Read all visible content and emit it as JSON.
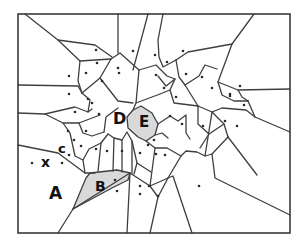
{
  "diagram": {
    "type": "voronoi",
    "frame": {
      "x": 18,
      "y": 14,
      "w": 272,
      "h": 219
    },
    "colors": {
      "edge": "#3f3f3f",
      "shade": "#d9d9d9",
      "site": "#2a2a2a",
      "label": "#111111"
    },
    "labels": [
      {
        "id": "A",
        "text": "A",
        "x": 49,
        "y": 199,
        "size": 17
      },
      {
        "id": "B",
        "text": "B",
        "x": 95,
        "y": 191,
        "size": 14
      },
      {
        "id": "C",
        "text": "c",
        "x": 58,
        "y": 153,
        "size": 13
      },
      {
        "id": "D",
        "text": "D",
        "x": 113,
        "y": 124,
        "size": 16
      },
      {
        "id": "E",
        "text": "E",
        "x": 139,
        "y": 127,
        "size": 15
      },
      {
        "id": "X",
        "text": "x",
        "x": 41,
        "y": 167,
        "size": 14
      }
    ],
    "shaded_cells": [
      {
        "id": "B",
        "points": "90,173 117,170 130,173 128,180 112,188 73,209 86,178"
      },
      {
        "id": "E",
        "points": "133,110 141,106 152,113 158,124 155,135 146,141 138,137 128,128 127,117"
      }
    ],
    "sites": [
      [
        96,
        50
      ],
      [
        133,
        51
      ],
      [
        155,
        55
      ],
      [
        183,
        51
      ],
      [
        167,
        62
      ],
      [
        97,
        63
      ],
      [
        118,
        68
      ],
      [
        119,
        73
      ],
      [
        86,
        73
      ],
      [
        69,
        76
      ],
      [
        102,
        81
      ],
      [
        156,
        75
      ],
      [
        186,
        74
      ],
      [
        202,
        77
      ],
      [
        164,
        88
      ],
      [
        212,
        88
      ],
      [
        230,
        94
      ],
      [
        240,
        86
      ],
      [
        69,
        94
      ],
      [
        88,
        99
      ],
      [
        92,
        103
      ],
      [
        176,
        97
      ],
      [
        75,
        112
      ],
      [
        99,
        114
      ],
      [
        170,
        116
      ],
      [
        182,
        124
      ],
      [
        203,
        126
      ],
      [
        225,
        121
      ],
      [
        237,
        126
      ],
      [
        230,
        96
      ],
      [
        244,
        105
      ],
      [
        68,
        131
      ],
      [
        86,
        131
      ],
      [
        74,
        140
      ],
      [
        81,
        146
      ],
      [
        96,
        149
      ],
      [
        107,
        151
      ],
      [
        122,
        151
      ],
      [
        140,
        153
      ],
      [
        154,
        140
      ],
      [
        156,
        154
      ],
      [
        165,
        155
      ],
      [
        69,
        155
      ],
      [
        62,
        163
      ],
      [
        115,
        180
      ],
      [
        117,
        191
      ],
      [
        140,
        186
      ],
      [
        149,
        186
      ],
      [
        140,
        194
      ],
      [
        158,
        196
      ],
      [
        199,
        186
      ],
      [
        32,
        163
      ],
      [
        148,
        145
      ]
    ],
    "edges": [
      "M 25,14 L 58,40 L 95,45 L 112,57",
      "M 58,40 L 80,61 L 78,81 L 82,93",
      "M 80,61 L 111,59 L 120,53 L 139,70",
      "M 118,14 L 118,53",
      "M 148,14 L 133,70",
      "M 163,14 L 158,40 L 159,57 L 163,67 L 176,60",
      "M 176,60 L 188,52 L 232,44 L 254,14",
      "M 232,44 L 218,82 L 222,95 L 234,101 L 248,101",
      "M 248,101 L 242,97 L 238,90 L 218,82",
      "M 238,90 L 290,89",
      "M 248,101 L 255,117 L 290,132",
      "M 255,117 L 246,110 L 222,108 L 212,112",
      "M 18,85 L 78,86 L 82,93",
      "M 82,93 L 100,78 L 111,59",
      "M 100,78 L 118,101 L 133,103",
      "M 82,93 L 90,100 L 88,112",
      "M 18,113 L 45,114 L 75,107 L 88,112 L 92,109",
      "M 45,114 L 63,123 L 79,123 L 100,115",
      "M 79,123 L 83,133 L 92,136 L 104,132",
      "M 104,132 L 106,117 L 118,108",
      "M 139,70 L 136,103 L 133,110",
      "M 139,70 L 156,65 L 167,76 L 175,79 L 170,90 L 174,103 L 198,106",
      "M 136,103 L 160,94 L 170,90",
      "M 158,76 L 166,86 L 175,79",
      "M 176,60 L 179,77 L 185,85 L 199,76 L 205,65 L 217,69",
      "M 185,85 L 198,106 L 212,112 L 224,124 L 228,137",
      "M 198,106 L 198,124 L 209,134 L 224,124",
      "M 209,134 L 200,148",
      "M 228,137 L 212,154 L 205,156 L 197,152 L 186,151 L 181,156",
      "M 212,154 L 215,178 L 290,215",
      "M 228,137 L 257,175",
      "M 212,112 L 205,156",
      "M 18,145 L 58,153 L 85,173 L 95,173",
      "M 63,123 L 70,133 L 75,156 L 83,160 L 85,173",
      "M 83,160 L 89,149 L 101,143 L 108,134",
      "M 101,143 L 98,171",
      "M 108,134 L 114,138 L 113,171",
      "M 114,138 L 122,140 L 122,172",
      "M 122,140 L 127,132 L 132,141 L 132,173",
      "M 132,141 L 137,163 L 134,174",
      "M 146,141 L 155,148 L 167,148 L 181,156 L 168,178 L 150,186",
      "M 155,148 L 150,186",
      "M 137,163 L 151,172",
      "M 130,173 L 150,186 L 158,197 L 168,178",
      "M 158,197 L 150,233",
      "M 130,173 L 127,233",
      "M 168,178 L 173,176 L 192,233",
      "M 73,209 L 58,233",
      "M 130,173 L 73,209",
      "M 155,135 L 162,133 L 168,138",
      "M 158,124 L 170,116 L 178,121 L 186,115 L 186,133 L 190,139"
    ]
  }
}
